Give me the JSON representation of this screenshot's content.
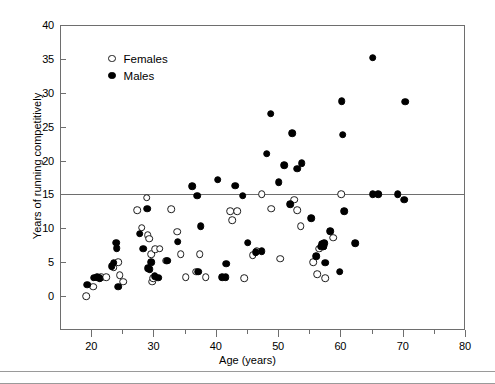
{
  "chart_data": {
    "type": "scatter",
    "title": "",
    "xlabel": "Age (years)",
    "ylabel": "Years of running competitively",
    "xlim": [
      15,
      80
    ],
    "ylim": [
      -5,
      40
    ],
    "xticks": [
      20,
      30,
      40,
      50,
      60,
      70,
      80
    ],
    "xticks_minor": [
      25,
      35,
      45,
      55,
      65,
      75
    ],
    "yticks": [
      0,
      5,
      10,
      15,
      20,
      25,
      30,
      35,
      40
    ],
    "grid": false,
    "legend_position": "upper left inside",
    "annotations": [
      {
        "name": "reference-line",
        "type": "hline",
        "y": 15,
        "label": ""
      }
    ],
    "series": [
      {
        "name": "Females",
        "marker": "open-circle",
        "color": "#ffffff",
        "edge_color": "#1a1a1a",
        "points": [
          [
            19.2,
            0.0
          ],
          [
            20.3,
            1.4
          ],
          [
            21.6,
            2.8
          ],
          [
            22.4,
            2.8
          ],
          [
            23.6,
            4.2
          ],
          [
            24.3,
            5.0
          ],
          [
            24.6,
            3.1
          ],
          [
            25.1,
            2.1
          ],
          [
            27.4,
            12.7
          ],
          [
            28.1,
            10.1
          ],
          [
            28.9,
            14.5
          ],
          [
            29.1,
            9.0
          ],
          [
            29.3,
            8.5
          ],
          [
            29.6,
            6.2
          ],
          [
            29.8,
            2.1
          ],
          [
            30.0,
            2.6
          ],
          [
            30.3,
            6.9
          ],
          [
            31.0,
            7.0
          ],
          [
            32.0,
            5.2
          ],
          [
            32.8,
            12.8
          ],
          [
            33.8,
            9.5
          ],
          [
            34.4,
            6.2
          ],
          [
            35.2,
            2.8
          ],
          [
            36.9,
            3.6
          ],
          [
            37.4,
            6.2
          ],
          [
            38.4,
            2.8
          ],
          [
            42.3,
            12.5
          ],
          [
            42.6,
            11.2
          ],
          [
            43.4,
            12.5
          ],
          [
            44.6,
            2.6
          ],
          [
            45.9,
            6.0
          ],
          [
            46.6,
            6.6
          ],
          [
            47.4,
            15.0
          ],
          [
            48.9,
            12.9
          ],
          [
            50.3,
            5.5
          ],
          [
            52.6,
            14.2
          ],
          [
            53.1,
            12.7
          ],
          [
            53.6,
            10.3
          ],
          [
            55.6,
            5.0
          ],
          [
            56.3,
            3.2
          ],
          [
            56.6,
            7.0
          ],
          [
            57.3,
            7.4
          ],
          [
            57.6,
            2.6
          ],
          [
            58.8,
            8.6
          ],
          [
            60.1,
            15.0
          ]
        ]
      },
      {
        "name": "Males",
        "marker": "filled-circle",
        "color": "#000000",
        "edge_color": "#000000",
        "points": [
          [
            19.4,
            1.7
          ],
          [
            20.4,
            2.7
          ],
          [
            21.0,
            2.8
          ],
          [
            21.4,
            2.6
          ],
          [
            23.3,
            4.4
          ],
          [
            23.6,
            4.9
          ],
          [
            24.0,
            7.9
          ],
          [
            24.1,
            7.1
          ],
          [
            24.3,
            1.4
          ],
          [
            27.8,
            9.2
          ],
          [
            28.4,
            7.0
          ],
          [
            29.0,
            12.9
          ],
          [
            29.1,
            4.1
          ],
          [
            29.4,
            4.0
          ],
          [
            29.6,
            5.0
          ],
          [
            30.2,
            2.9
          ],
          [
            30.8,
            2.7
          ],
          [
            32.2,
            5.2
          ],
          [
            33.9,
            8.0
          ],
          [
            36.2,
            16.2
          ],
          [
            37.0,
            14.8
          ],
          [
            37.2,
            3.6
          ],
          [
            37.6,
            10.3
          ],
          [
            40.3,
            17.2
          ],
          [
            41.0,
            2.8
          ],
          [
            41.6,
            2.8
          ],
          [
            41.7,
            4.8
          ],
          [
            43.1,
            16.3
          ],
          [
            44.3,
            14.8
          ],
          [
            45.1,
            7.9
          ],
          [
            46.4,
            6.5
          ],
          [
            47.4,
            6.6
          ],
          [
            48.2,
            21.0
          ],
          [
            48.8,
            26.9
          ],
          [
            50.1,
            16.8
          ],
          [
            51.0,
            19.3
          ],
          [
            51.9,
            13.6
          ],
          [
            52.3,
            24.0
          ],
          [
            53.1,
            18.8
          ],
          [
            53.8,
            19.6
          ],
          [
            55.3,
            11.5
          ],
          [
            56.1,
            5.9
          ],
          [
            56.9,
            7.3
          ],
          [
            57.0,
            7.7
          ],
          [
            57.3,
            7.3
          ],
          [
            57.4,
            7.8
          ],
          [
            57.6,
            4.9
          ],
          [
            58.4,
            9.6
          ],
          [
            59.9,
            3.6
          ],
          [
            60.2,
            28.8
          ],
          [
            60.4,
            23.8
          ],
          [
            60.6,
            12.5
          ],
          [
            62.4,
            7.8
          ],
          [
            65.2,
            35.2
          ],
          [
            65.2,
            15.0
          ],
          [
            66.1,
            15.0
          ],
          [
            69.2,
            15.0
          ],
          [
            70.2,
            14.2
          ],
          [
            70.4,
            28.7
          ]
        ]
      }
    ]
  },
  "legend": {
    "items": [
      {
        "label": "Females",
        "marker": "open-circle"
      },
      {
        "label": "Males",
        "marker": "filled-circle"
      }
    ]
  },
  "axes": {
    "x_title": "Age (years)",
    "y_title": "Years of running competitively",
    "x_tick_labels": [
      "20",
      "30",
      "40",
      "50",
      "60",
      "70",
      "80"
    ],
    "y_tick_labels": [
      "0",
      "5",
      "10",
      "15",
      "20",
      "25",
      "30",
      "35",
      "40"
    ]
  },
  "colors": {
    "axis": "#6e6e6e",
    "male": "#000000",
    "female_fill": "#ffffff",
    "female_edge": "#1a1a1a",
    "background": "#ffffff"
  }
}
